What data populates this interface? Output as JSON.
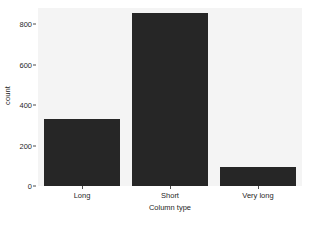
{
  "chart_data": {
    "type": "bar",
    "title": "",
    "subtitle": "",
    "categories": [
      "Long",
      "Short",
      "Very long"
    ],
    "values": [
      333,
      857,
      95
    ],
    "xlabel": "Column type",
    "ylabel": "count",
    "ylim": [
      0,
      880
    ],
    "yticks": [
      0,
      200,
      400,
      600,
      800
    ],
    "ytick_labels": [
      "0",
      "200",
      "400",
      "600",
      "800"
    ],
    "grid": false,
    "legend": "none",
    "series": [
      {
        "name": "count",
        "values": [
          333,
          857,
          95
        ]
      }
    ],
    "colors": {
      "bar_fill": "#262626",
      "panel_background": "#f4f4f4",
      "page_background": "#ffffff",
      "axis_text": "#1f1f1f",
      "tick_mark": "#4d4d4d"
    }
  }
}
